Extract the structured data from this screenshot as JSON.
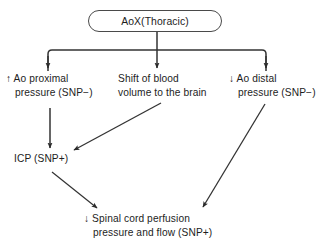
{
  "diagram": {
    "type": "flowchart",
    "title_node": {
      "id": "aox",
      "label": "AoX(Thoracic)",
      "shape": "rounded-rectangle"
    },
    "nodes": [
      {
        "id": "ao-proximal-pressure",
        "line1": "↑ Ao proximal",
        "line2": "pressure (SNP−)",
        "direction": "increase",
        "snp": "−"
      },
      {
        "id": "shift-of-blood-volume",
        "line1": "Shift of blood",
        "line2": "volume to the brain",
        "direction": "none",
        "snp": ""
      },
      {
        "id": "ao-distal-pressure",
        "line1": "↓ Ao distal",
        "line2": "pressure (SNP−)",
        "direction": "decrease",
        "snp": "−"
      },
      {
        "id": "icp",
        "line1": "ICP (SNP+)",
        "line2": "",
        "direction": "none",
        "snp": "+"
      },
      {
        "id": "spinal-cord-perfusion",
        "line1": "↓ Spinal cord perfusion",
        "line2": "pressure and flow (SNP+)",
        "direction": "decrease",
        "snp": "+"
      }
    ],
    "edges": [
      {
        "id": "aox-to-proximal",
        "from": "aox",
        "to": "ao-proximal-pressure",
        "style": "elbow-arrow"
      },
      {
        "id": "aox-to-shift",
        "from": "aox",
        "to": "shift-of-blood-volume",
        "style": "straight-arrow"
      },
      {
        "id": "aox-to-distal",
        "from": "aox",
        "to": "ao-distal-pressure",
        "style": "elbow-arrow"
      },
      {
        "id": "proximal-to-icp",
        "from": "ao-proximal-pressure",
        "to": "icp",
        "style": "straight-arrow"
      },
      {
        "id": "shift-to-icp",
        "from": "shift-of-blood-volume",
        "to": "icp",
        "style": "diagonal-arrow"
      },
      {
        "id": "icp-to-spinal",
        "from": "icp",
        "to": "spinal-cord-perfusion",
        "style": "diagonal-arrow"
      },
      {
        "id": "distal-to-spinal",
        "from": "ao-distal-pressure",
        "to": "spinal-cord-perfusion",
        "style": "diagonal-arrow"
      }
    ],
    "colors": {
      "stroke": "#333333",
      "box_border": "#4a4a4a",
      "text": "#1d1d1d",
      "background": "#ffffff"
    }
  }
}
